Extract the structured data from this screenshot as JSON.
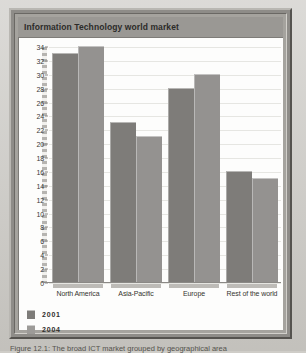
{
  "figure": {
    "title": "Information Technology world market",
    "caption": "Figure 12.1: The broad ICT market grouped by geographical area"
  },
  "chart_data": {
    "type": "bar",
    "title": "Information Technology world market",
    "categories": [
      "North America",
      "Asia-Pacific",
      "Europe",
      "Rest of the world"
    ],
    "series": [
      {
        "name": "2001",
        "values": [
          33,
          23,
          28,
          16
        ],
        "color": "#7e7c79"
      },
      {
        "name": "2004",
        "values": [
          34,
          21,
          30,
          15
        ],
        "color": "#949290"
      }
    ],
    "xlabel": "",
    "ylabel": "",
    "ylim": [
      0,
      34
    ],
    "ytick_step": 2,
    "yticks": [
      34,
      32,
      30,
      28,
      26,
      24,
      22,
      20,
      18,
      16,
      14,
      12,
      10,
      8,
      6,
      4,
      2,
      0
    ],
    "grid": true,
    "legend_position": "bottom-left"
  },
  "colors": {
    "series_2001": "#7e7c79",
    "series_2004": "#949290",
    "title_band": "#9a9894",
    "frame": "#8e8c88",
    "canvas": "#fdfdfc",
    "page_background": "#c9c7c2"
  }
}
